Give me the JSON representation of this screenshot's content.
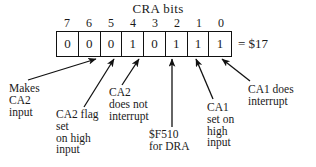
{
  "diagram": {
    "title": "CRA bits",
    "hex_value": "= $17",
    "register": {
      "bit_numbers": [
        "7",
        "6",
        "5",
        "4",
        "3",
        "2",
        "1",
        "0"
      ],
      "bit_values": [
        "0",
        "0",
        "0",
        "1",
        "0",
        "1",
        "1",
        "1"
      ]
    },
    "callouts": [
      {
        "id": "makes-ca2-input",
        "lines": [
          "Makes",
          "CA2",
          "input"
        ],
        "target_bit": "5"
      },
      {
        "id": "ca2-flag-set-on-high-input",
        "lines": [
          "CA2 flag",
          "set",
          "on high",
          "input"
        ],
        "target_bit": "4"
      },
      {
        "id": "ca2-does-not-interrupt",
        "lines": [
          "CA2",
          "does not",
          "interrupt"
        ],
        "target_bit": "3"
      },
      {
        "id": "f510-for-dra",
        "lines": [
          "$F510",
          "for DRA"
        ],
        "target_bit": "2"
      },
      {
        "id": "ca1-set-on-high-input",
        "lines": [
          "CA1",
          "set on",
          "high",
          "input"
        ],
        "target_bit": "1"
      },
      {
        "id": "ca1-does-interrupt",
        "lines": [
          "CA1 does",
          "interrupt"
        ],
        "target_bit": "0"
      }
    ],
    "colors": {
      "ink": "#1a1a1a",
      "line": "#111111",
      "background": "#ffffff"
    }
  }
}
